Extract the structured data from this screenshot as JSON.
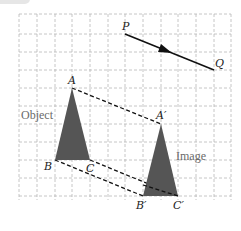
{
  "diagram": {
    "grid": {
      "x0": 19,
      "y0": 14,
      "x1": 231,
      "y1": 200,
      "step": 17.7,
      "color": "#b8b8b8"
    },
    "vector": {
      "start": {
        "label": "P",
        "x": 125,
        "y": 34
      },
      "end": {
        "label": "Q",
        "x": 214,
        "y": 70
      },
      "color": "#111111"
    },
    "object": {
      "word": "Object",
      "fill": "#555555",
      "vertices": [
        {
          "label": "A",
          "x": 72,
          "y": 88
        },
        {
          "label": "B",
          "x": 55,
          "y": 160
        },
        {
          "label": "C",
          "x": 90,
          "y": 160
        }
      ]
    },
    "image": {
      "word": "Image",
      "fill": "#555555",
      "vertices": [
        {
          "label": "A′",
          "x": 161,
          "y": 124
        },
        {
          "label": "B′",
          "x": 143,
          "y": 196
        },
        {
          "label": "C′",
          "x": 178,
          "y": 196
        }
      ]
    },
    "labels": {
      "P": "P",
      "Q": "Q",
      "A": "A",
      "B": "B",
      "C": "C",
      "A_prime": "A′",
      "B_prime": "B′",
      "C_prime": "C′",
      "object_word": "Object",
      "image_word": "Image"
    }
  }
}
